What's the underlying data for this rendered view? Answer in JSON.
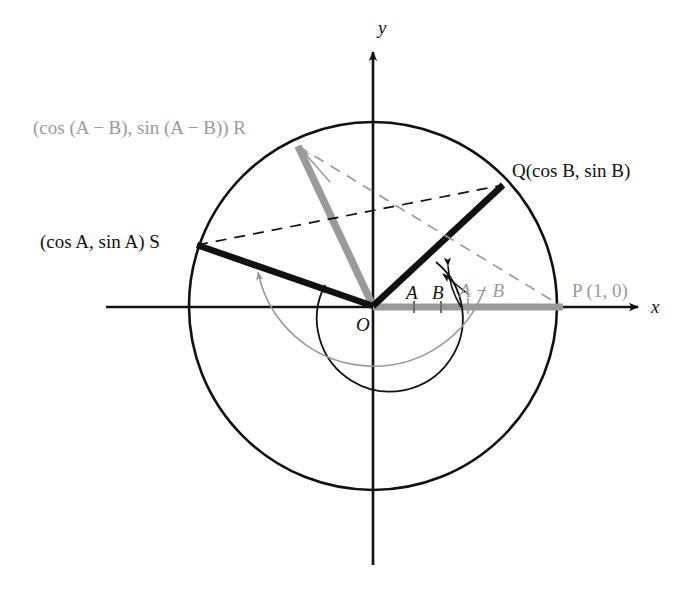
{
  "figure": {
    "axes": {
      "x_label": "x",
      "y_label": "y"
    },
    "colors": {
      "stroke_dark": "#111111",
      "stroke_gray": "#9a9a9a",
      "background": "#ffffff"
    },
    "points": [
      {
        "key": "origin",
        "label": "O",
        "x": 373,
        "y": 306,
        "color": "#111111"
      },
      {
        "key": "P",
        "label": "P (1, 0)",
        "x": 563,
        "y": 307,
        "color": "#9a9a9a"
      },
      {
        "key": "Q",
        "label": "Q(cos B, sin B)",
        "x": 503,
        "y": 185,
        "color": "#111111"
      },
      {
        "key": "S",
        "label": "(cos A, sin A) S",
        "x": 196,
        "y": 245,
        "color": "#111111"
      },
      {
        "key": "R",
        "label": "(cos (A − B), sin (A − B)) R",
        "x": 297,
        "y": 145,
        "color": "#9a9a9a"
      }
    ],
    "angles": [
      {
        "key": "A",
        "label": "A",
        "color": "#111111"
      },
      {
        "key": "B",
        "label": "B",
        "color": "#111111"
      },
      {
        "key": "A_minus_B",
        "label": "A − B",
        "color": "#9a9a9a"
      }
    ],
    "segments": [
      {
        "key": "OS",
        "from": "origin",
        "to": "S",
        "style": "solid-thick",
        "color": "#111111"
      },
      {
        "key": "OQ",
        "from": "origin",
        "to": "Q",
        "style": "solid-thick",
        "color": "#111111"
      },
      {
        "key": "OR",
        "from": "origin",
        "to": "R",
        "style": "solid-thick",
        "color": "#9a9a9a"
      },
      {
        "key": "OP",
        "from": "origin",
        "to": "P",
        "style": "solid-thick",
        "color": "#9a9a9a"
      },
      {
        "key": "SQ",
        "from": "S",
        "to": "Q",
        "style": "dashed",
        "color": "#111111"
      },
      {
        "key": "RP",
        "from": "R",
        "to": "P",
        "style": "dashed",
        "color": "#9a9a9a"
      }
    ],
    "circle": {
      "cx": 373,
      "cy": 306,
      "r": 184,
      "color": "#111111"
    }
  }
}
